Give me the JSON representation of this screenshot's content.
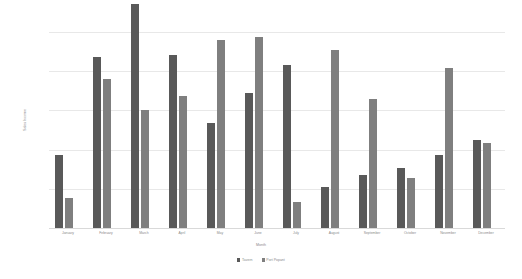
{
  "chart_data": {
    "type": "bar",
    "title": "",
    "xlabel": "Month",
    "ylabel": "Sales Income",
    "categories": [
      "January",
      "February",
      "March",
      "April",
      "May",
      "June",
      "July",
      "August",
      "September",
      "October",
      "November",
      "December"
    ],
    "series": [
      {
        "name": "Tavern",
        "color": "#595959",
        "values": [
          3750,
          8700,
          11450,
          8850,
          5350,
          6900,
          8300,
          2100,
          2700,
          3050,
          3700,
          4500
        ]
      },
      {
        "name": "Port Popant",
        "color": "#7f7f7f",
        "values": [
          1550,
          7600,
          6000,
          6750,
          9600,
          9750,
          1350,
          9100,
          6600,
          2550,
          8150,
          4350
        ]
      }
    ],
    "ylim": [
      0,
      10000
    ],
    "yticks": [
      0,
      2000,
      4000,
      6000,
      8000,
      10000
    ],
    "ytick_labels": [
      "0.00",
      "2,000.00",
      "4,000.00",
      "6,000.00",
      "8,000.00",
      "10,000.00"
    ],
    "grid": true,
    "legend_position": "bottom"
  },
  "legend": {
    "items": [
      {
        "label": "Tavern",
        "color": "#595959"
      },
      {
        "label": "Port Popant",
        "color": "#7f7f7f"
      }
    ]
  },
  "axes": {
    "x_title": "Month",
    "y_title": "Sales Income"
  }
}
